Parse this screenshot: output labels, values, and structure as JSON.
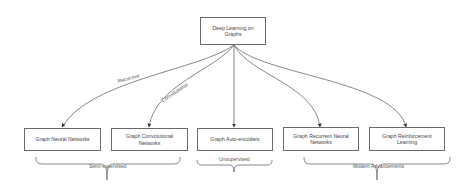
{
  "diagram": {
    "root": {
      "label": "Deep Learning on Graphs"
    },
    "children": [
      {
        "label": "Graph Neural Networks"
      },
      {
        "label": "Graph Convolutional Networks"
      },
      {
        "label": "Graph Auto-encoders"
      },
      {
        "label": "Graph Recurrent Neural Networks"
      },
      {
        "label": "Graph Reinforcement Learning"
      }
    ],
    "edge_labels": {
      "recursive": "Recursive",
      "convolutional": "Convolutional"
    },
    "groups": [
      {
        "label": "Semi-supervised"
      },
      {
        "label": "Unsupervised"
      },
      {
        "label": "Modern Advancements"
      }
    ],
    "colors": {
      "stroke": "#555555",
      "box_border": "#6a6a6a",
      "text": "#444444",
      "background": "#ffffff"
    }
  }
}
